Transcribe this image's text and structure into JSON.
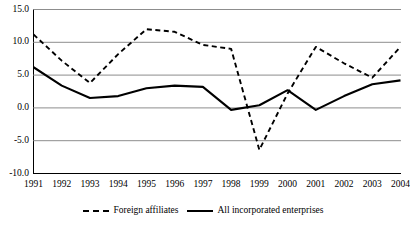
{
  "chart_data": {
    "type": "line",
    "title": "",
    "subtitle": "",
    "xlabel": "",
    "ylabel": "",
    "grid": true,
    "legend_position": "bottom",
    "xlim": [
      1991,
      2004
    ],
    "ylim": [
      -10.0,
      15.0
    ],
    "categories": [
      "1991",
      "1992",
      "1993",
      "1994",
      "1995",
      "1996",
      "1997",
      "1998",
      "1999",
      "2000",
      "2001",
      "2002",
      "2003",
      "2004"
    ],
    "x": [
      1991,
      1992,
      1993,
      1994,
      1995,
      1996,
      1997,
      1998,
      1999,
      2000,
      2001,
      2002,
      2003,
      2004
    ],
    "yticks": [
      "-10.0",
      "-5.0",
      "0.0",
      "5.0",
      "10.0",
      "15.0"
    ],
    "ytick_values": [
      -10.0,
      -5.0,
      0.0,
      5.0,
      10.0,
      15.0
    ],
    "series": [
      {
        "name": "Foreign affiliates",
        "style": "dashed",
        "color": "#000000",
        "values": [
          11.2,
          7.2,
          3.8,
          8.2,
          12.0,
          11.6,
          9.6,
          9.0,
          -6.4,
          2.2,
          9.3,
          6.8,
          4.6,
          9.3
        ]
      },
      {
        "name": "All incorporated enterprises",
        "style": "solid",
        "color": "#000000",
        "values": [
          6.2,
          3.4,
          1.5,
          1.8,
          3.0,
          3.4,
          3.2,
          -0.3,
          0.4,
          2.7,
          -0.3,
          1.8,
          3.6,
          4.2
        ]
      }
    ]
  },
  "legend": {
    "items": [
      {
        "label": "Foreign affiliates",
        "style": "dashed"
      },
      {
        "label": "All incorporated enterprises",
        "style": "solid"
      }
    ]
  },
  "colors": {
    "line": "#000000",
    "grid": "#808080",
    "axis": "#000000",
    "background": "#ffffff"
  }
}
